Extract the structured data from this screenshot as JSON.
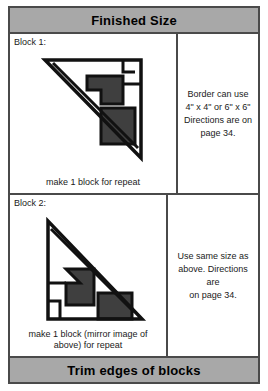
{
  "chart": {
    "header_label": "Finished Size",
    "footer_label": "Trim edges of blocks"
  },
  "rows": [
    {
      "block_label": "Block 1:",
      "caption": "make 1 block for repeat",
      "note_lines": [
        "Border can use",
        "4\" x 4\" or 6\" x 6\"",
        "Directions are on",
        "page 34."
      ]
    },
    {
      "block_label": "Block 2:",
      "caption_line_1": "make 1 block (mirror image",
      "caption_line_2": "of above) for repeat",
      "note_lines": [
        "Use same size as",
        "above. Directions are",
        "on page 34."
      ]
    }
  ],
  "colors": {
    "banner_gray": "#a8a8a8",
    "frame_gray": "#4a4a4a",
    "patch_dark_gray": "#3f3f3f",
    "outline_black": "#111111",
    "background_white": "#ffffff"
  },
  "diagrams": {
    "block1": {
      "type": "half-square-triangle-corner-block",
      "orientation": "hypotenuse-lower-left-to-upper-right",
      "description": "Right triangle with apex at upper-left, dark gray stepped patches along inner right edge, notch marks at upper-right corner"
    },
    "block2": {
      "type": "half-square-triangle-corner-block-mirrored",
      "orientation": "hypotenuse-upper-left-to-lower-right",
      "description": "Mirror image of Block 1: right triangle with vertical left leg, dark gray stepped patches, notch marks at lower-left corner"
    }
  }
}
